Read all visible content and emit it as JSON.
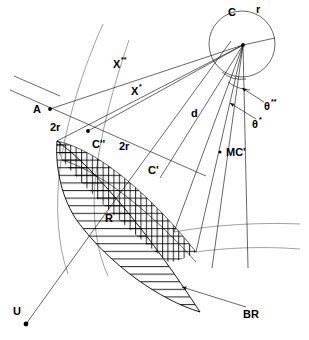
{
  "diagram": {
    "type": "technical-line-diagram",
    "background_color": "#ffffff",
    "line_color": "#000000",
    "secondary_line_color": "#888888",
    "labels": {
      "center": "C",
      "radius": "r",
      "point_a": "A",
      "point_c_prime": "C'",
      "point_c_double_prime": "C''",
      "point_r": "R",
      "point_u": "U",
      "point_mc_prime": "MC'",
      "distance_d": "d",
      "chord_x_star": "X",
      "chord_x_star_sup": "*",
      "chord_x_double_star": "X",
      "chord_x_double_star_sup": "**",
      "two_r_left": "2r",
      "two_r_right": "2r",
      "theta_star": "θ",
      "theta_star_sup": "*",
      "theta_double_star": "θ",
      "theta_double_star_sup": "**",
      "boundary_br": "BR"
    },
    "geometry": {
      "circle": {
        "cx": 242,
        "cy": 44,
        "r": 33
      },
      "apex": {
        "x": 243,
        "y": 45
      },
      "points": [
        {
          "name": "A",
          "x": 50,
          "y": 109
        },
        {
          "name": "C''",
          "x": 88,
          "y": 131
        },
        {
          "name": "MC'",
          "x": 220,
          "y": 152
        },
        {
          "name": "U",
          "x": 26,
          "y": 324
        }
      ],
      "lens_tip_top": {
        "x": 57,
        "y": 141
      },
      "lens_tip_bottom": {
        "x": 200,
        "y": 312
      }
    },
    "annotations": {
      "angle_arc_count": 2,
      "arrow_count": 3,
      "hatch_style_outer": "horizontal",
      "hatch_style_inner": "cross-hatch"
    }
  }
}
